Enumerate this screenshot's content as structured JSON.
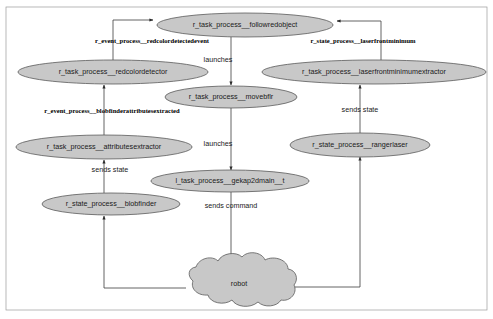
{
  "diagram": {
    "colors": {
      "node_fill": "#c8c8c8",
      "node_stroke": "#5a5a5a",
      "edge_stroke": "#3d3d3d",
      "background": "#ffffff",
      "frame": "#9a9a9a"
    },
    "nodes": [
      {
        "id": "followredobject",
        "label": "r_task_process__followredobject",
        "shape": "ellipse",
        "cx": 245,
        "cy": 25,
        "rx": 88,
        "ry": 12
      },
      {
        "id": "redcolordetector",
        "label": "r_task_process__redcolordetector",
        "shape": "ellipse",
        "cx": 113,
        "cy": 72,
        "rx": 95,
        "ry": 12
      },
      {
        "id": "laserfrontminimumextractor",
        "label": "r_task_process__laserfrontminimumextractor",
        "shape": "ellipse",
        "cx": 374,
        "cy": 72,
        "rx": 112,
        "ry": 12
      },
      {
        "id": "movebflr",
        "label": "r_task_process__movebflr",
        "shape": "ellipse",
        "cx": 231,
        "cy": 97,
        "rx": 66,
        "ry": 11
      },
      {
        "id": "attributesextractor",
        "label": "r_task_process__attributesextractor",
        "shape": "ellipse",
        "cx": 104,
        "cy": 147,
        "rx": 88,
        "ry": 12
      },
      {
        "id": "rangerlaser",
        "label": "r_state_process__rangerlaser",
        "shape": "ellipse",
        "cx": 360,
        "cy": 145,
        "rx": 70,
        "ry": 12
      },
      {
        "id": "gekap2dmain",
        "label": "l_task_process__gekap2dmain__t",
        "shape": "ellipse",
        "cx": 230,
        "cy": 181,
        "rx": 79,
        "ry": 11
      },
      {
        "id": "blobfinder",
        "label": "r_state_process__blobfinder",
        "shape": "ellipse",
        "cx": 111,
        "cy": 204,
        "rx": 69,
        "ry": 11
      },
      {
        "id": "robot",
        "label": "robot",
        "shape": "cloud",
        "cx": 239,
        "cy": 284,
        "rx": 57,
        "ry": 24
      }
    ],
    "edge_labels": [
      {
        "id": "redcolordetectedevent",
        "text": "r_event_process__redcolordetectedevent",
        "x": 152,
        "y": 41,
        "style": "bold"
      },
      {
        "id": "laserfrontminimum",
        "text": "r_state_process__laserfrontminimum",
        "x": 363,
        "y": 41,
        "style": "bold"
      },
      {
        "id": "blobfinderattributesextracted",
        "text": "r_event_process__blobfinderattributesextracted",
        "x": 112,
        "y": 111,
        "style": "bold"
      },
      {
        "id": "launches-top",
        "text": "launches",
        "x": 218,
        "y": 60,
        "style": "plain"
      },
      {
        "id": "launches-bottom",
        "text": "launches",
        "x": 218,
        "y": 144,
        "style": "plain"
      },
      {
        "id": "sends-state-right",
        "text": "sends state",
        "x": 360,
        "y": 110,
        "style": "plain"
      },
      {
        "id": "sends-state-left",
        "text": "sends state",
        "x": 110,
        "y": 170,
        "style": "plain"
      },
      {
        "id": "sends-command",
        "text": "sends command",
        "x": 231,
        "y": 206,
        "style": "plain"
      }
    ],
    "edges": [
      {
        "from": "redcolordetector",
        "to": "followredobject",
        "label": "redcolordetectedevent"
      },
      {
        "from": "laserfrontminimumextractor",
        "to": "followredobject",
        "label": "laserfrontminimum"
      },
      {
        "from": "followredobject",
        "to": "movebflr",
        "label": "launches-top"
      },
      {
        "from": "attributesextractor",
        "to": "redcolordetector",
        "label": "blobfinderattributesextracted"
      },
      {
        "from": "rangerlaser",
        "to": "laserfrontminimumextractor",
        "label": "sends-state-right"
      },
      {
        "from": "blobfinder",
        "to": "attributesextractor",
        "label": "sends-state-left"
      },
      {
        "from": "movebflr",
        "to": "gekap2dmain",
        "label": "launches-bottom"
      },
      {
        "from": "gekap2dmain",
        "to": "robot",
        "label": "sends-command"
      },
      {
        "from": "robot",
        "to": "blobfinder",
        "label": ""
      },
      {
        "from": "robot",
        "to": "rangerlaser",
        "label": ""
      }
    ]
  }
}
